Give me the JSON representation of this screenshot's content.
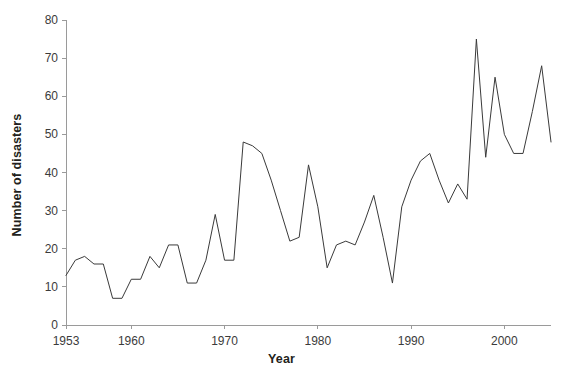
{
  "chart_data": {
    "type": "line",
    "title": "",
    "xlabel": "Year",
    "ylabel": "Number of disasters",
    "xlim": [
      1953,
      2005
    ],
    "ylim": [
      0,
      80
    ],
    "grid": false,
    "legend": false,
    "xticks": [
      1953,
      1960,
      1970,
      1980,
      1990,
      2000
    ],
    "xtick_labels": [
      "1953",
      "1960",
      "1970",
      "1980",
      "1990",
      "2000"
    ],
    "yticks": [
      0,
      10,
      20,
      30,
      40,
      50,
      60,
      70,
      80
    ],
    "ytick_labels": [
      "0",
      "10",
      "20",
      "30",
      "40",
      "50",
      "60",
      "70",
      "80"
    ],
    "line_color": "#3a3a3a",
    "line_width": 1,
    "x": [
      1953,
      1954,
      1955,
      1956,
      1957,
      1958,
      1959,
      1960,
      1961,
      1962,
      1963,
      1964,
      1965,
      1966,
      1967,
      1968,
      1969,
      1970,
      1971,
      1972,
      1973,
      1974,
      1975,
      1976,
      1977,
      1978,
      1979,
      1980,
      1981,
      1982,
      1983,
      1984,
      1985,
      1986,
      1987,
      1988,
      1989,
      1990,
      1991,
      1992,
      1993,
      1994,
      1995,
      1996,
      1997,
      1998,
      1999,
      2000,
      2001,
      2002,
      2003,
      2004,
      2005
    ],
    "values": [
      13,
      17,
      18,
      16,
      16,
      7,
      7,
      12,
      12,
      18,
      15,
      21,
      21,
      11,
      11,
      17,
      29,
      17,
      17,
      48,
      47,
      45,
      38,
      30,
      22,
      23,
      42,
      31,
      15,
      21,
      22,
      21,
      27,
      34,
      23,
      11,
      31,
      38,
      43,
      45,
      38,
      32,
      37,
      33,
      75,
      44,
      65,
      50,
      45,
      45,
      56,
      68,
      48
    ],
    "series": [
      {
        "name": "Number of disasters",
        "values": [
          13,
          17,
          18,
          16,
          16,
          7,
          7,
          12,
          12,
          18,
          15,
          21,
          21,
          11,
          11,
          17,
          29,
          17,
          17,
          48,
          47,
          45,
          38,
          30,
          22,
          23,
          42,
          31,
          15,
          21,
          22,
          21,
          27,
          34,
          23,
          11,
          31,
          38,
          43,
          45,
          38,
          32,
          37,
          33,
          75,
          44,
          65,
          50,
          45,
          45,
          56,
          68,
          48
        ]
      }
    ]
  }
}
